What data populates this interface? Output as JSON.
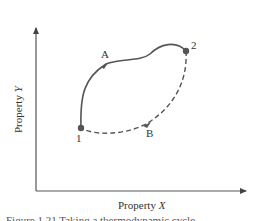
{
  "axes": {
    "x_label_prefix": "Property ",
    "x_label_var": "X",
    "y_label_prefix": "Property ",
    "y_label_var": "Y"
  },
  "points": [
    {
      "id": "1",
      "label": "1",
      "x": 81,
      "y": 128
    },
    {
      "id": "2",
      "label": "2",
      "x": 186,
      "y": 51
    }
  ],
  "paths": [
    {
      "id": "A",
      "label": "A",
      "style": "solid",
      "from": "1",
      "to": "2"
    },
    {
      "id": "B",
      "label": "B",
      "style": "dashed",
      "from": "2",
      "to": "1"
    }
  ],
  "caption": "Figure 1.21 Taking a thermodynamic cycle"
}
